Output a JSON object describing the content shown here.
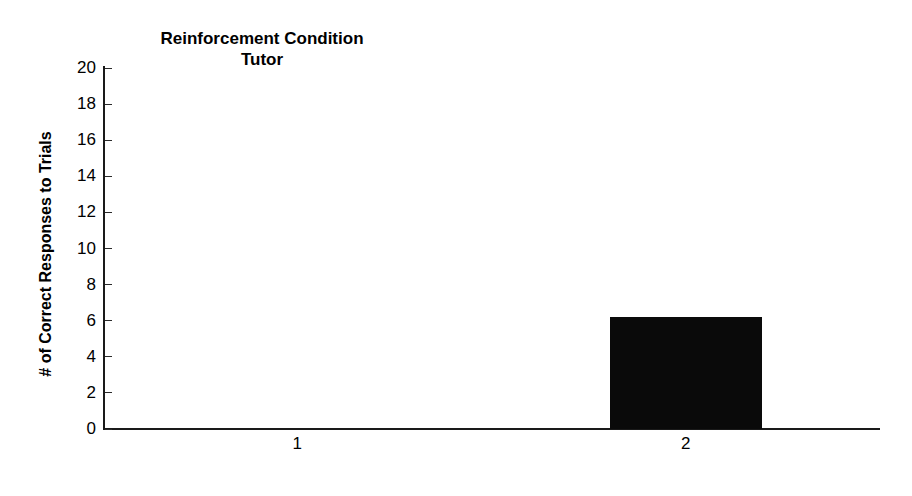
{
  "chart_data": {
    "type": "bar",
    "title": "Reinforcement Condition Tutor",
    "title_lines": [
      "Reinforcement Condition",
      "Tutor"
    ],
    "xlabel": "",
    "ylabel": "# of Correct Responses to Trials",
    "categories": [
      "1",
      "2"
    ],
    "values": [
      0,
      6.2
    ],
    "ylim": [
      0,
      20
    ],
    "yticks": [
      0,
      2,
      4,
      6,
      8,
      10,
      12,
      14,
      16,
      18,
      20
    ],
    "ytick_labels": [
      "0",
      "2",
      "4",
      "6",
      "8",
      "10",
      "12",
      "14",
      "16",
      "18",
      "20"
    ],
    "grid": false,
    "legend": false,
    "bar_color": "#0a0a0a",
    "axis_color": "#1a1a1a"
  },
  "title": {
    "line1": "Reinforcement Condition",
    "line2": "Tutor"
  },
  "axes": {
    "y_axis_title": "# of Correct Responses to Trials"
  }
}
